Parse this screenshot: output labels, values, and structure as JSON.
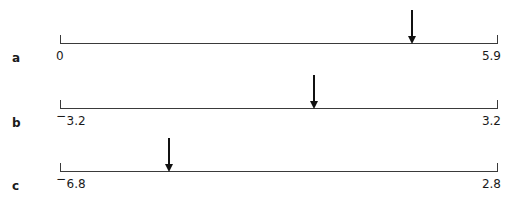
{
  "figure": {
    "background_color": "#ffffff",
    "line_color": "#3a3a3a",
    "arrow_color": "#111111",
    "text_color": "#1a1a1a"
  },
  "chart_data": {
    "type": "line",
    "title": "",
    "subtitle": "",
    "xlabel": "",
    "ylabel": "",
    "grid": false,
    "legend": null,
    "panels": [
      {
        "id": "a",
        "label": "a",
        "left_label": "0",
        "right_label": "5.9",
        "left_value": 0,
        "right_value": 5.9,
        "left_negative": false,
        "right_negative": false,
        "arrow_fraction": 0.803,
        "arrow_value": 4.74,
        "arrow_label": ""
      },
      {
        "id": "b",
        "label": "b",
        "left_label": "3.2",
        "right_label": "3.2",
        "left_value": -3.2,
        "right_value": 3.2,
        "left_negative": true,
        "right_negative": false,
        "arrow_fraction": 0.58,
        "arrow_value": 0.51,
        "arrow_label": ""
      },
      {
        "id": "c",
        "label": "c",
        "left_label": "6.8",
        "right_label": "2.8",
        "left_value": -6.8,
        "right_value": 2.8,
        "left_negative": true,
        "right_negative": false,
        "arrow_fraction": 0.247,
        "arrow_value": -4.43,
        "arrow_label": ""
      }
    ],
    "axis_geometry": {
      "left_x": 60,
      "right_x": 497,
      "baselines_y": [
        43,
        108,
        171
      ],
      "tick_top_offset": -8,
      "tick_bottom_offset": 1,
      "arrow_shaft_length": 26,
      "arrow_head_height": 8
    }
  }
}
